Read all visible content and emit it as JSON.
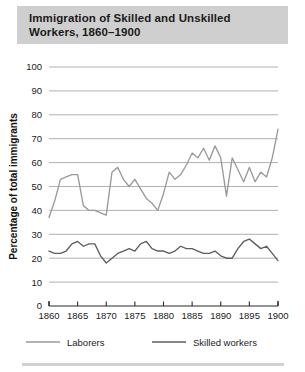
{
  "title": {
    "line1": "Immigration of Skilled and Unskilled",
    "line2": "Workers, 1860–1900",
    "full": "Immigration of Skilled and Unskilled\nWorkers, 1860–1900"
  },
  "colors": {
    "title_bar_background": "#cfcfcf",
    "laborers_line": "#9a9a9a",
    "skilled_line": "#5e5e5e",
    "gridline": "#a8a8a8",
    "axis": "#2b2b2b",
    "text": "#1b1b1b",
    "page_background": "#ffffff",
    "bottom_rule": "#d2d2d2"
  },
  "axes": {
    "y_label": "Percentage of total immigrants",
    "y_ticks": [
      "0",
      "10",
      "20",
      "30",
      "40",
      "50",
      "60",
      "70",
      "80",
      "90",
      "100"
    ],
    "x_ticks": [
      "1860",
      "1865",
      "1870",
      "1875",
      "1880",
      "1885",
      "1890",
      "1895",
      "1900"
    ]
  },
  "legend": {
    "position": "bottom",
    "items": [
      {
        "label": "Laborers",
        "color": "#9a9a9a"
      },
      {
        "label": "Skilled workers",
        "color": "#5e5e5e"
      }
    ]
  },
  "chart_data": {
    "type": "line",
    "title": "Immigration of Skilled and Unskilled Workers, 1860–1900",
    "xlabel": "",
    "ylabel": "Percentage of total immigrants",
    "xlim": [
      1860,
      1900
    ],
    "ylim": [
      0,
      100
    ],
    "y_tick_values": [
      0,
      10,
      20,
      30,
      40,
      50,
      60,
      70,
      80,
      90,
      100
    ],
    "x_tick_values": [
      1860,
      1865,
      1870,
      1875,
      1880,
      1885,
      1890,
      1895,
      1900
    ],
    "grid": true,
    "legend_position": "bottom",
    "x": [
      1860,
      1861,
      1862,
      1863,
      1864,
      1865,
      1866,
      1867,
      1868,
      1869,
      1870,
      1871,
      1872,
      1873,
      1874,
      1875,
      1876,
      1877,
      1878,
      1879,
      1880,
      1881,
      1882,
      1883,
      1884,
      1885,
      1886,
      1887,
      1888,
      1889,
      1890,
      1891,
      1892,
      1893,
      1894,
      1895,
      1896,
      1897,
      1898,
      1899,
      1900
    ],
    "series": [
      {
        "name": "Laborers",
        "color": "#9a9a9a",
        "values": [
          37,
          44,
          53,
          54,
          55,
          55,
          42,
          40,
          40,
          39,
          38,
          56,
          58,
          53,
          50,
          53,
          49,
          45,
          43,
          40,
          47,
          56,
          53,
          55,
          59,
          64,
          62,
          66,
          61,
          67,
          62,
          46,
          62,
          57,
          52,
          58,
          52,
          56,
          54,
          62,
          74
        ]
      },
      {
        "name": "Skilled workers",
        "color": "#5e5e5e",
        "values": [
          23,
          22,
          22,
          23,
          26,
          27,
          25,
          26,
          26,
          21,
          18,
          20,
          22,
          23,
          24,
          23,
          26,
          27,
          24,
          23,
          23,
          22,
          23,
          25,
          24,
          24,
          23,
          22,
          22,
          23,
          21,
          20,
          20,
          24,
          27,
          28,
          26,
          24,
          25,
          22,
          19
        ]
      }
    ]
  }
}
